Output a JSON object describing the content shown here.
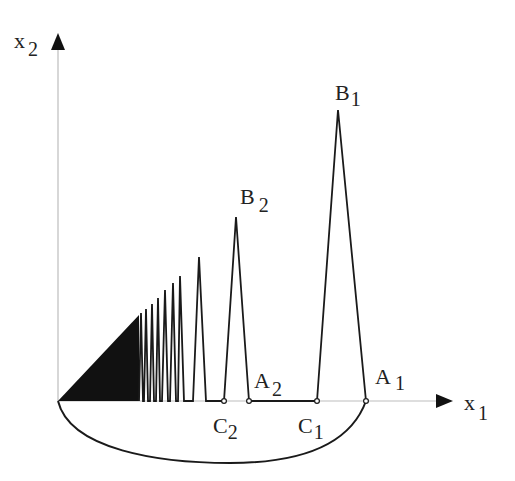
{
  "diagram": {
    "type": "spike-curve-construction",
    "axes": {
      "x": {
        "label": "x",
        "subscript": "1"
      },
      "y": {
        "label": "x",
        "subscript": "2"
      }
    },
    "points": [
      {
        "id": "B1",
        "label": "B",
        "subscript": "1",
        "role": "peak of first spike"
      },
      {
        "id": "B2",
        "label": "B",
        "subscript": "2",
        "role": "peak of second spike"
      },
      {
        "id": "A1",
        "label": "A",
        "subscript": "1",
        "role": "right base of first spike"
      },
      {
        "id": "A2",
        "label": "A",
        "subscript": "2",
        "role": "right base of second spike"
      },
      {
        "id": "C1",
        "label": "C",
        "subscript": "1",
        "role": "left base of first spike"
      },
      {
        "id": "C2",
        "label": "C",
        "subscript": "2",
        "role": "left base of second spike"
      }
    ],
    "colors": {
      "stroke": "#1a1a1a",
      "axis": "#bdbdbd",
      "fill": "#111111"
    }
  }
}
